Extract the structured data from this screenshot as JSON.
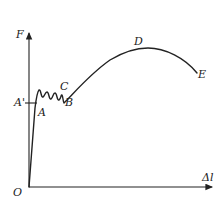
{
  "diagram": {
    "axes": {
      "y_label": "F",
      "x_label": "Δl",
      "origin_label": "O"
    },
    "points": [
      {
        "id": "A_prime",
        "label": "A'"
      },
      {
        "id": "A",
        "label": "A"
      },
      {
        "id": "B",
        "label": "B"
      },
      {
        "id": "C",
        "label": "C"
      },
      {
        "id": "D",
        "label": "D"
      },
      {
        "id": "E",
        "label": "E"
      }
    ],
    "colors": {
      "line": "#222222",
      "background": "#ffffff"
    }
  }
}
